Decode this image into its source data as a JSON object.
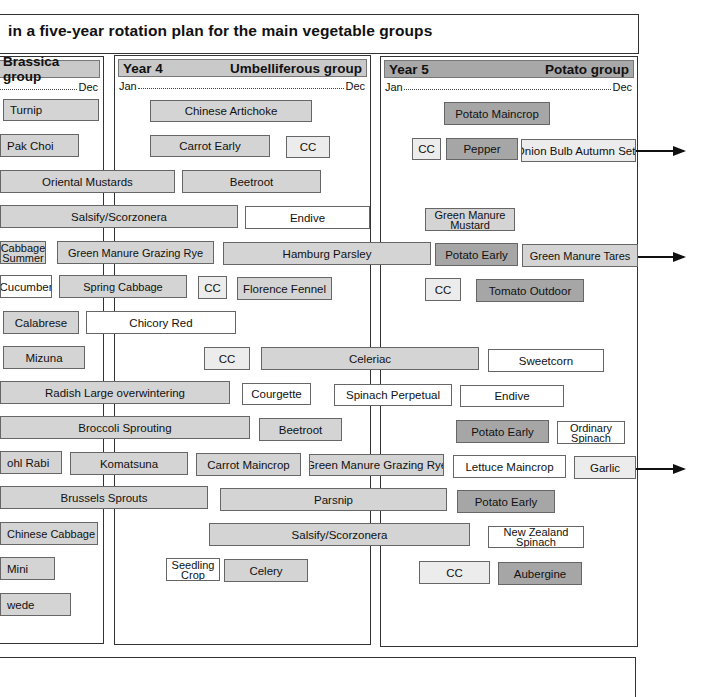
{
  "title": "in a five-year rotation plan for the main vegetable groups",
  "panels": [
    {
      "id": "brassica",
      "year": "",
      "group": "Brassica group",
      "start": "",
      "end": "Dec",
      "x": -6,
      "y": 56,
      "w": 110,
      "h": 588,
      "dark": false
    },
    {
      "id": "umbelliferous",
      "year": "Year 4",
      "group": "Umbelliferous group",
      "start": "Jan",
      "end": "Dec",
      "x": 114,
      "y": 55,
      "w": 257,
      "h": 590,
      "dark": false
    },
    {
      "id": "potato",
      "year": "Year 5",
      "group": "Potato group",
      "start": "Jan",
      "end": "Dec",
      "x": 380,
      "y": 56,
      "w": 258,
      "h": 591,
      "dark": true
    }
  ],
  "bars": [
    {
      "label": "Turnip",
      "x": 3,
      "y": 99,
      "w": 96,
      "h": 22,
      "fill": "g-light",
      "align": "left"
    },
    {
      "label": "Chinese Artichoke",
      "x": 150,
      "y": 100,
      "w": 162,
      "h": 22,
      "fill": "g-light"
    },
    {
      "label": "Potato Maincrop",
      "x": 444,
      "y": 102,
      "w": 106,
      "h": 23,
      "fill": "g-dark"
    },
    {
      "label": "Pak Choi",
      "x": 0,
      "y": 134,
      "w": 79,
      "h": 23,
      "fill": "g-light",
      "align": "left"
    },
    {
      "label": "Carrot Early",
      "x": 150,
      "y": 135,
      "w": 120,
      "h": 22,
      "fill": "g-light"
    },
    {
      "label": "CC",
      "x": 286,
      "y": 136,
      "w": 44,
      "h": 22,
      "fill": "g-pale"
    },
    {
      "label": "CC",
      "x": 412,
      "y": 138,
      "w": 29,
      "h": 22,
      "fill": "g-pale"
    },
    {
      "label": "Pepper",
      "x": 446,
      "y": 138,
      "w": 72,
      "h": 22,
      "fill": "g-dark"
    },
    {
      "label": "Onion Bulb Autumn Sets",
      "x": 521,
      "y": 139,
      "w": 115,
      "h": 23,
      "fill": "g-pale"
    },
    {
      "label": "Oriental Mustards",
      "x": 0,
      "y": 170,
      "w": 175,
      "h": 23,
      "fill": "g-light"
    },
    {
      "label": "Beetroot",
      "x": 182,
      "y": 170,
      "w": 139,
      "h": 23,
      "fill": "g-light"
    },
    {
      "label": "Salsify/Scorzonera",
      "x": 0,
      "y": 205,
      "w": 238,
      "h": 23,
      "fill": "g-light"
    },
    {
      "label": "Endive",
      "x": 245,
      "y": 206,
      "w": 125,
      "h": 23,
      "fill": "g-white"
    },
    {
      "label": "Green Manure Mustard",
      "x": 425,
      "y": 208,
      "w": 90,
      "h": 23,
      "fill": "g-light",
      "two": true
    },
    {
      "label": "Cabbage Summer",
      "x": 0,
      "y": 241,
      "w": 46,
      "h": 23,
      "fill": "g-light",
      "two": true
    },
    {
      "label": "Green Manure Grazing Rye",
      "x": 57,
      "y": 241,
      "w": 157,
      "h": 23,
      "fill": "g-light",
      "two": true
    },
    {
      "label": "Hamburg Parsley",
      "x": 223,
      "y": 242,
      "w": 208,
      "h": 23,
      "fill": "g-light"
    },
    {
      "label": "Potato Early",
      "x": 435,
      "y": 243,
      "w": 83,
      "h": 23,
      "fill": "g-dark"
    },
    {
      "label": "Green Manure Tares",
      "x": 522,
      "y": 244,
      "w": 116,
      "h": 23,
      "fill": "g-light",
      "two": true
    },
    {
      "label": "Cucumber",
      "x": 0,
      "y": 275,
      "w": 52,
      "h": 23,
      "fill": "g-white"
    },
    {
      "label": "Spring Cabbage",
      "x": 59,
      "y": 275,
      "w": 128,
      "h": 23,
      "fill": "g-light",
      "two": true
    },
    {
      "label": "CC",
      "x": 198,
      "y": 276,
      "w": 29,
      "h": 23,
      "fill": "g-pale"
    },
    {
      "label": "Florence Fennel",
      "x": 237,
      "y": 277,
      "w": 95,
      "h": 23,
      "fill": "g-light"
    },
    {
      "label": "CC",
      "x": 425,
      "y": 278,
      "w": 36,
      "h": 23,
      "fill": "g-pale"
    },
    {
      "label": "Tomato Outdoor",
      "x": 476,
      "y": 279,
      "w": 108,
      "h": 23,
      "fill": "g-dark"
    },
    {
      "label": "Calabrese",
      "x": 3,
      "y": 311,
      "w": 76,
      "h": 23,
      "fill": "g-light"
    },
    {
      "label": "Chicory Red",
      "x": 86,
      "y": 311,
      "w": 150,
      "h": 23,
      "fill": "g-white"
    },
    {
      "label": "Mizuna",
      "x": 3,
      "y": 346,
      "w": 82,
      "h": 23,
      "fill": "g-light"
    },
    {
      "label": "CC",
      "x": 204,
      "y": 347,
      "w": 46,
      "h": 23,
      "fill": "g-pale"
    },
    {
      "label": "Celeriac",
      "x": 261,
      "y": 347,
      "w": 218,
      "h": 23,
      "fill": "g-light"
    },
    {
      "label": "Sweetcorn",
      "x": 488,
      "y": 349,
      "w": 116,
      "h": 23,
      "fill": "g-white"
    },
    {
      "label": "Radish Large overwintering",
      "x": 0,
      "y": 381,
      "w": 230,
      "h": 23,
      "fill": "g-light"
    },
    {
      "label": "Courgette",
      "x": 242,
      "y": 383,
      "w": 69,
      "h": 22,
      "fill": "g-white"
    },
    {
      "label": "Spinach Perpetual",
      "x": 334,
      "y": 384,
      "w": 118,
      "h": 22,
      "fill": "g-white"
    },
    {
      "label": "Endive",
      "x": 460,
      "y": 385,
      "w": 104,
      "h": 22,
      "fill": "g-white"
    },
    {
      "label": "Broccoli Sprouting",
      "x": 0,
      "y": 416,
      "w": 250,
      "h": 23,
      "fill": "g-light"
    },
    {
      "label": "Beetroot",
      "x": 259,
      "y": 418,
      "w": 83,
      "h": 23,
      "fill": "g-light"
    },
    {
      "label": "Potato Early",
      "x": 456,
      "y": 420,
      "w": 93,
      "h": 23,
      "fill": "g-dark"
    },
    {
      "label": "Ordinary Spinach",
      "x": 557,
      "y": 421,
      "w": 68,
      "h": 23,
      "fill": "g-white",
      "two": true
    },
    {
      "label": "ohl Rabi",
      "x": 0,
      "y": 451,
      "w": 62,
      "h": 23,
      "fill": "g-light",
      "align": "left"
    },
    {
      "label": "Komatsuna",
      "x": 70,
      "y": 452,
      "w": 118,
      "h": 23,
      "fill": "g-light"
    },
    {
      "label": "Carrot Maincrop",
      "x": 196,
      "y": 453,
      "w": 105,
      "h": 23,
      "fill": "g-light"
    },
    {
      "label": "Green Manure Grazing Rye",
      "x": 309,
      "y": 454,
      "w": 135,
      "h": 22,
      "fill": "g-light"
    },
    {
      "label": "Lettuce Maincrop",
      "x": 453,
      "y": 455,
      "w": 113,
      "h": 23,
      "fill": "g-white"
    },
    {
      "label": "Garlic",
      "x": 574,
      "y": 456,
      "w": 62,
      "h": 23,
      "fill": "g-pale"
    },
    {
      "label": "Brussels Sprouts",
      "x": 0,
      "y": 486,
      "w": 208,
      "h": 23,
      "fill": "g-light"
    },
    {
      "label": "Parsnip",
      "x": 220,
      "y": 488,
      "w": 227,
      "h": 23,
      "fill": "g-light"
    },
    {
      "label": "Potato Early",
      "x": 457,
      "y": 490,
      "w": 98,
      "h": 23,
      "fill": "g-dark"
    },
    {
      "label": "Chinese Cabbage",
      "x": 0,
      "y": 522,
      "w": 98,
      "h": 23,
      "fill": "g-light",
      "two": true,
      "align": "left"
    },
    {
      "label": "Salsify/Scorzonera",
      "x": 209,
      "y": 523,
      "w": 261,
      "h": 23,
      "fill": "g-light"
    },
    {
      "label": "New Zealand Spinach",
      "x": 488,
      "y": 526,
      "w": 96,
      "h": 22,
      "fill": "g-white",
      "two": true
    },
    {
      "label": "Mini",
      "x": 0,
      "y": 557,
      "w": 55,
      "h": 23,
      "fill": "g-light",
      "align": "left"
    },
    {
      "label": "Seedling Crop",
      "x": 166,
      "y": 558,
      "w": 54,
      "h": 23,
      "fill": "g-white",
      "two": true
    },
    {
      "label": "Celery",
      "x": 224,
      "y": 559,
      "w": 84,
      "h": 23,
      "fill": "g-light"
    },
    {
      "label": "CC",
      "x": 419,
      "y": 561,
      "w": 71,
      "h": 23,
      "fill": "g-pale"
    },
    {
      "label": "Aubergine",
      "x": 498,
      "y": 562,
      "w": 84,
      "h": 23,
      "fill": "g-dark"
    },
    {
      "label": "wede",
      "x": 0,
      "y": 593,
      "w": 71,
      "h": 23,
      "fill": "g-light",
      "align": "left"
    }
  ],
  "arrows": [
    {
      "id": "onion-carryover",
      "x": 636,
      "y": 150,
      "w": 48
    },
    {
      "id": "tares-carryover",
      "x": 638,
      "y": 256,
      "w": 46
    },
    {
      "id": "garlic-carryover",
      "x": 636,
      "y": 468,
      "w": 48
    }
  ]
}
